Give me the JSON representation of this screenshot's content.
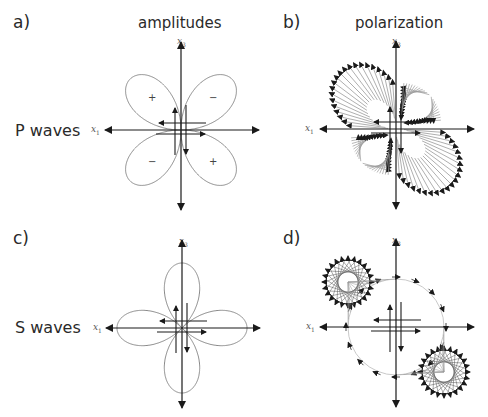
{
  "panels": {
    "a": {
      "letter": "a)",
      "title": "amplitudes",
      "row_label": "P waves",
      "center": [
        181,
        130
      ],
      "signs": [
        "+",
        "−",
        "−",
        "+"
      ]
    },
    "b": {
      "letter": "b)",
      "title": "polarization",
      "center": [
        396,
        129
      ]
    },
    "c": {
      "letter": "c)",
      "row_label": "S waves",
      "center": [
        182,
        328
      ]
    },
    "d": {
      "letter": "d)",
      "center": [
        396,
        327
      ]
    }
  },
  "axes": {
    "x1": "x",
    "x1_sub": "1",
    "x3": "x",
    "x3_sub": "3"
  },
  "colors": {
    "axis": "#1a1a1a",
    "lobe": "#8a8a8a",
    "ray": "#9a9a9a",
    "text": "#2a2a2a"
  }
}
